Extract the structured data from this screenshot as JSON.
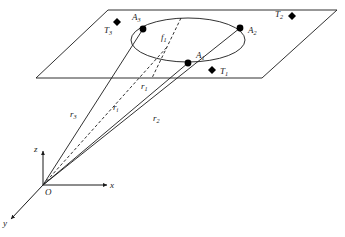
{
  "figure": {
    "background_color": "#ffffff",
    "line_color": "#1a1a1a"
  },
  "axes": {
    "origin_label": "O",
    "x_label": "x",
    "y_label": "y",
    "z_label": "z",
    "origin": {
      "x": 43,
      "y": 185
    },
    "x_tip": {
      "x": 107,
      "y": 185
    },
    "y_tip": {
      "x": 11,
      "y": 219
    },
    "z_tip": {
      "x": 43,
      "y": 151
    }
  },
  "plane": {
    "name": "image-plane",
    "corners": [
      {
        "x": 108,
        "y": 10
      },
      {
        "x": 337,
        "y": 10
      },
      {
        "x": 262,
        "y": 78
      },
      {
        "x": 36,
        "y": 78
      }
    ]
  },
  "ellipse": {
    "name": "footprint-ellipse",
    "cx": 188,
    "cy": 40,
    "rx": 57,
    "ry": 22
  },
  "focal_line": {
    "label": "f",
    "sub": "1",
    "label_x": 161,
    "label_y": 40,
    "from": {
      "x": 181,
      "y": 18
    },
    "to": {
      "x": 152,
      "y": 78
    }
  },
  "points": [
    {
      "id": "A1",
      "label": "A",
      "sub": "1",
      "marker": "circle",
      "x": 188,
      "y": 63,
      "label_x": 196,
      "label_y": 58
    },
    {
      "id": "A2",
      "label": "A",
      "sub": "2",
      "marker": "circle",
      "x": 240,
      "y": 28,
      "label_x": 248,
      "label_y": 33
    },
    {
      "id": "A3",
      "label": "A",
      "sub": "3",
      "marker": "circle",
      "x": 143,
      "y": 29,
      "label_x": 132,
      "label_y": 20
    },
    {
      "id": "T1",
      "label": "T",
      "sub": "1",
      "marker": "diamond",
      "x": 212,
      "y": 70,
      "label_x": 220,
      "label_y": 74
    },
    {
      "id": "T2",
      "label": "T",
      "sub": "2",
      "marker": "diamond",
      "x": 292,
      "y": 16,
      "label_x": 275,
      "label_y": 17
    },
    {
      "id": "T3",
      "label": "T",
      "sub": "3",
      "marker": "diamond",
      "x": 117,
      "y": 22,
      "label_x": 104,
      "label_y": 33
    }
  ],
  "rays": [
    {
      "id": "r3",
      "label": "r",
      "sub": "3",
      "style": "solid",
      "from": {
        "x": 43,
        "y": 185
      },
      "to": {
        "x": 143,
        "y": 29
      },
      "label_x": 70,
      "label_y": 117
    },
    {
      "id": "ri",
      "label": "r",
      "sub": "i",
      "style": "dashed",
      "from": {
        "x": 43,
        "y": 185
      },
      "to": {
        "x": 167,
        "y": 47
      },
      "label_x": 113,
      "label_y": 110
    },
    {
      "id": "r1",
      "label": "r",
      "sub": "1",
      "style": "solid",
      "from": {
        "x": 43,
        "y": 185
      },
      "to": {
        "x": 188,
        "y": 63
      },
      "label_x": 141,
      "label_y": 89
    },
    {
      "id": "r2",
      "label": "r",
      "sub": "2",
      "style": "solid",
      "from": {
        "x": 43,
        "y": 185
      },
      "to": {
        "x": 240,
        "y": 28
      },
      "label_x": 153,
      "label_y": 121
    }
  ]
}
